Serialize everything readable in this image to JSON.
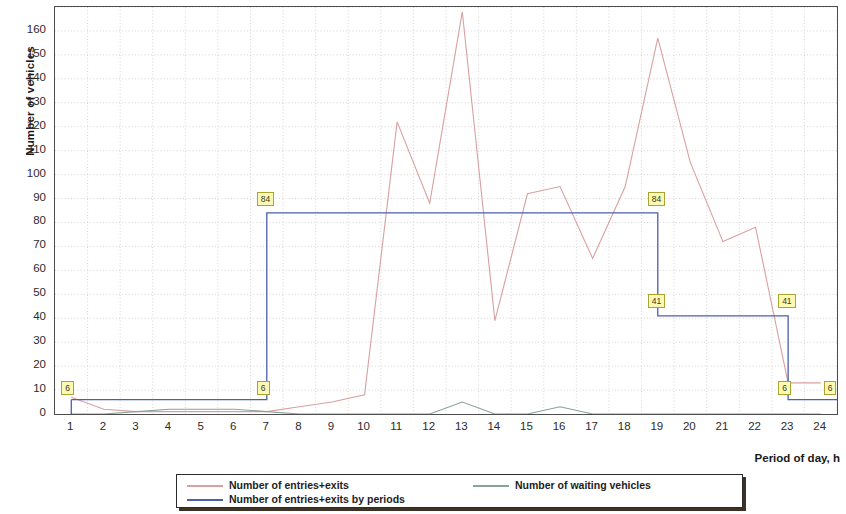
{
  "chart_data": {
    "type": "line",
    "title": "",
    "xlabel": "Period of day, h",
    "ylabel": "Number of vehicles",
    "xlim": [
      0.5,
      24.5
    ],
    "ylim": [
      0,
      170
    ],
    "ytick_step": 10,
    "grid": true,
    "legend_position": "bottom",
    "x": [
      1,
      2,
      3,
      4,
      5,
      6,
      7,
      8,
      9,
      10,
      11,
      12,
      13,
      14,
      15,
      16,
      17,
      18,
      19,
      20,
      21,
      22,
      23,
      24
    ],
    "xticklabels": [
      "1",
      "2",
      "3",
      "4",
      "5",
      "6",
      "7",
      "8",
      "9",
      "10",
      "11",
      "12",
      "13",
      "14",
      "15",
      "16",
      "17",
      "18",
      "19",
      "20",
      "21",
      "22",
      "23",
      "24"
    ],
    "yticklabels": [
      "0",
      "10",
      "20",
      "30",
      "40",
      "50",
      "60",
      "70",
      "80",
      "90",
      "100",
      "110",
      "120",
      "130",
      "140",
      "150",
      "160"
    ],
    "series": [
      {
        "name": "Number of entries+exits",
        "color": "#d9a0a0",
        "type": "line",
        "values": [
          7,
          2,
          1,
          1,
          1,
          1,
          1,
          3,
          5,
          8,
          122,
          88,
          168,
          39,
          92,
          95,
          65,
          95,
          157,
          105,
          72,
          78,
          13,
          13
        ]
      },
      {
        "name": "Number of waiting vehicles",
        "color": "#8aa39a",
        "type": "line",
        "values": [
          0,
          0,
          1,
          2,
          2,
          2,
          1,
          0,
          0,
          0,
          0,
          0,
          5,
          0,
          0,
          3,
          0,
          0,
          0,
          0,
          0,
          0,
          0,
          0
        ]
      },
      {
        "name": "Number of entries+exits by periods",
        "color": "#4a5fae",
        "type": "step",
        "steps": [
          {
            "from": 1,
            "to": 7,
            "value": 6
          },
          {
            "from": 7,
            "to": 19,
            "value": 84
          },
          {
            "from": 19,
            "to": 23,
            "value": 41
          },
          {
            "from": 23,
            "to": 24.5,
            "value": 6
          }
        ]
      }
    ],
    "annotations": [
      {
        "label": "6",
        "x": 1,
        "y": 11,
        "series": "Number of entries+exits by periods"
      },
      {
        "label": "6",
        "x": 7,
        "y": 11,
        "series": "Number of entries+exits by periods"
      },
      {
        "label": "84",
        "x": 7,
        "y": 90,
        "series": "Number of entries+exits by periods"
      },
      {
        "label": "84",
        "x": 19,
        "y": 90,
        "series": "Number of entries+exits by periods"
      },
      {
        "label": "41",
        "x": 19,
        "y": 47,
        "series": "Number of entries+exits by periods"
      },
      {
        "label": "41",
        "x": 23,
        "y": 47,
        "series": "Number of entries+exits by periods"
      },
      {
        "label": "6",
        "x": 23,
        "y": 11,
        "series": "Number of entries+exits by periods"
      },
      {
        "label": "6",
        "x": 24.4,
        "y": 11,
        "series": "Number of entries+exits by periods"
      }
    ]
  },
  "axis": {
    "y_title": "Number of vehicles",
    "x_title": "Period of day, h"
  },
  "legend": {
    "entries": [
      {
        "label": "Number of entries+exits",
        "color": "#d9a0a0"
      },
      {
        "label": "Number of entries+exits by periods",
        "color": "#4a5fae"
      },
      {
        "label": "Number of waiting vehicles",
        "color": "#8aa39a"
      }
    ]
  }
}
